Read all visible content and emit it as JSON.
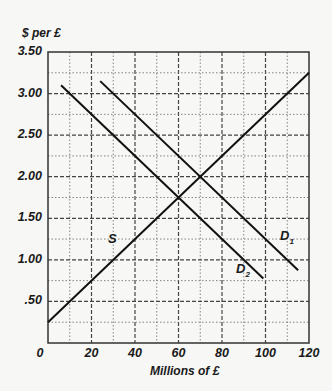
{
  "chart_data": {
    "type": "line",
    "title": "",
    "ylabel": "$ per £",
    "xlabel": "Millions of £",
    "xlim": [
      0,
      120
    ],
    "ylim": [
      0,
      3.5
    ],
    "x_ticks": [
      "0",
      "20",
      "40",
      "60",
      "80",
      "100",
      "120"
    ],
    "y_ticks": [
      "3.50",
      "3.00",
      "2.50",
      "2.00",
      "1.50",
      "1.00",
      ".50"
    ],
    "grid": true,
    "series": [
      {
        "name": "S",
        "label": "S",
        "points": [
          [
            0,
            0.25
          ],
          [
            120,
            3.25
          ]
        ]
      },
      {
        "name": "D1",
        "label": "D",
        "subscript": "1",
        "points": [
          [
            24,
            3.15
          ],
          [
            115,
            0.875
          ]
        ]
      },
      {
        "name": "D2",
        "label": "D",
        "subscript": "2",
        "points": [
          [
            6,
            3.1
          ],
          [
            99,
            0.775
          ]
        ]
      }
    ],
    "intersections": [
      {
        "curves": [
          "S",
          "D2"
        ],
        "x": 60,
        "y": 1.75
      },
      {
        "curves": [
          "S",
          "D1"
        ],
        "x": 70,
        "y": 2.0
      }
    ]
  }
}
